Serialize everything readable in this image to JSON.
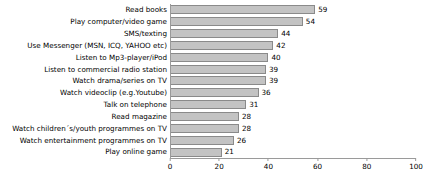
{
  "chart_data": {
    "type": "bar",
    "orientation": "horizontal",
    "title": "",
    "subtitle": "",
    "xlabel": "",
    "ylabel": "",
    "xlim": [
      0,
      100
    ],
    "xticks": [
      0,
      20,
      40,
      60,
      80,
      100
    ],
    "grid": false,
    "legend": false,
    "legend_position": "none",
    "data_labels": true,
    "bar_fill_color": "#c3c3c3",
    "bar_border_color": "#8a8a8a",
    "axis_color": "#9a9a9a",
    "text_color": "#000000",
    "categories": [
      "Read books",
      "Play computer/video game",
      "SMS/texting",
      "Use Messenger (MSN, ICQ, YAHOO etc)",
      "Listen to Mp3-player/iPod",
      "Listen to commercial radio station",
      "Watch drama/series on TV",
      "Watch videoclip (e.g.Youtube)",
      "Talk on telephone",
      "Read magazine",
      "Watch children´s/youth programmes on TV",
      "Watch entertainment programmes on TV",
      "Play online game"
    ],
    "values": [
      59,
      54,
      44,
      42,
      40,
      39,
      39,
      36,
      31,
      28,
      28,
      26,
      21
    ]
  }
}
